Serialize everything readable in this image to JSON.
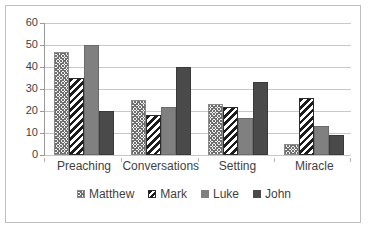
{
  "chart_data": {
    "type": "bar",
    "title": "",
    "subtitle": "",
    "xlabel": "",
    "ylabel": "",
    "categories": [
      "Preaching",
      "Conversations",
      "Setting",
      "Miracle"
    ],
    "series": [
      {
        "name": "Matthew",
        "values": [
          47,
          25,
          23,
          5
        ],
        "color": "#f2f2f2",
        "pattern": "zigzag-light"
      },
      {
        "name": "Mark",
        "values": [
          35,
          18,
          22,
          26
        ],
        "color": "#1c1c1c",
        "pattern": "diagonal-stripes-bold"
      },
      {
        "name": "Luke",
        "values": [
          50,
          22,
          17,
          13
        ],
        "color": "#808080",
        "pattern": "solid"
      },
      {
        "name": "John",
        "values": [
          20,
          40,
          33,
          9
        ],
        "color": "#4a4a4a",
        "pattern": "solid"
      }
    ],
    "ylim": [
      0,
      60
    ],
    "ytick_step": 10,
    "yticks": [
      0,
      10,
      20,
      30,
      40,
      50,
      60
    ],
    "ytick_labels": [
      "0",
      "10",
      "20",
      "30",
      "40",
      "50",
      "60"
    ],
    "grid": "horizontal",
    "legend_position": "bottom",
    "border_color": "#bfbfbf",
    "gridline_color": "#c8c8c8",
    "axis_color": "#9a9a9a",
    "text_color": "#3f3f3f",
    "background": "#ffffff"
  }
}
